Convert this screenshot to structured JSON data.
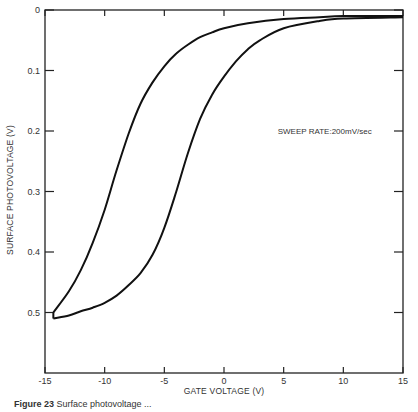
{
  "chart_data": {
    "type": "line",
    "title": "",
    "xlabel": "GATE VOLTAGE (V)",
    "ylabel": "SURFACE PHOTOVOLTAGE (V)",
    "xlim": [
      -15,
      15
    ],
    "ylim": [
      0,
      0.6
    ],
    "y_inverted": true,
    "x_ticks": [
      -15,
      -10,
      -5,
      0,
      5,
      10,
      15
    ],
    "x_tick_labels": [
      "-15",
      "-10",
      "-5",
      "0",
      "5",
      "10",
      "15"
    ],
    "y_ticks": [
      0,
      0.1,
      0.2,
      0.3,
      0.4,
      0.5
    ],
    "y_tick_labels": [
      "0",
      "0.1",
      "0.2",
      "0.3",
      "0.4",
      "0.5"
    ],
    "grid": false,
    "legend": null,
    "annotations": [
      {
        "text": "SWEEP RATE:200mV/sec",
        "x": 4.5,
        "y": 0.205
      }
    ],
    "series": [
      {
        "name": "sweep-left-branch",
        "x": [
          -14.3,
          -13,
          -12,
          -11,
          -10,
          -9,
          -8,
          -7,
          -6,
          -5,
          -4,
          -3,
          -2,
          -1,
          0,
          2,
          5,
          8,
          10,
          15
        ],
        "y": [
          0.5,
          0.465,
          0.43,
          0.385,
          0.33,
          0.265,
          0.205,
          0.155,
          0.12,
          0.093,
          0.072,
          0.057,
          0.045,
          0.037,
          0.03,
          0.022,
          0.015,
          0.012,
          0.01,
          0.01
        ]
      },
      {
        "name": "sweep-right-branch",
        "x": [
          -14.3,
          -13,
          -12,
          -11,
          -10,
          -9,
          -8,
          -7,
          -6,
          -5,
          -4,
          -3,
          -2,
          -1,
          0,
          1,
          2,
          3,
          5,
          8,
          10,
          15
        ],
        "y": [
          0.51,
          0.505,
          0.498,
          0.492,
          0.484,
          0.472,
          0.455,
          0.435,
          0.405,
          0.36,
          0.3,
          0.235,
          0.18,
          0.14,
          0.11,
          0.085,
          0.065,
          0.05,
          0.03,
          0.018,
          0.014,
          0.012
        ]
      }
    ]
  },
  "caption": {
    "label": "Figure 23",
    "text": "Surface photovoltage ..."
  }
}
